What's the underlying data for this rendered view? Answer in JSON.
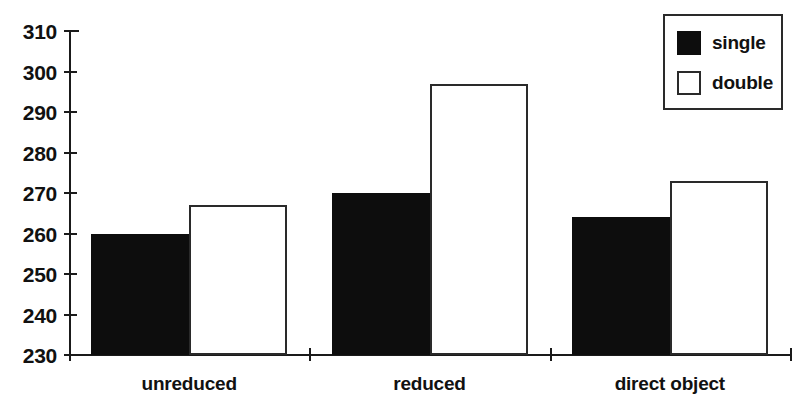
{
  "chart_data": {
    "type": "bar",
    "title": "",
    "subtitle": "",
    "xlabel": "",
    "ylabel": "",
    "categories": [
      "unreduced",
      "reduced",
      "direct object"
    ],
    "series": [
      {
        "name": "single",
        "values": [
          260,
          270,
          264
        ],
        "color": "#0d0d0d",
        "style": "filled"
      },
      {
        "name": "double",
        "values": [
          267,
          297,
          273
        ],
        "color": "#ffffff",
        "style": "hollow-outline"
      }
    ],
    "ylim": [
      230,
      310
    ],
    "ytick_step": 10,
    "yticks": [
      230,
      240,
      250,
      260,
      270,
      280,
      290,
      300,
      310
    ],
    "ytick_labels": [
      "230",
      "240",
      "250",
      "260",
      "270",
      "280",
      "290",
      "300",
      "310"
    ],
    "grid": false,
    "legend": {
      "position": "top-right",
      "entries": [
        {
          "label": "single",
          "swatch": "filled-square-black"
        },
        {
          "label": "double",
          "swatch": "hollow-square-white"
        }
      ]
    },
    "annotations": [],
    "colors": {
      "axis": "#1a1a1a",
      "single_fill": "#0d0d0d",
      "double_fill": "#ffffff",
      "double_stroke": "#2a2a2a",
      "background": "#ffffff"
    }
  }
}
